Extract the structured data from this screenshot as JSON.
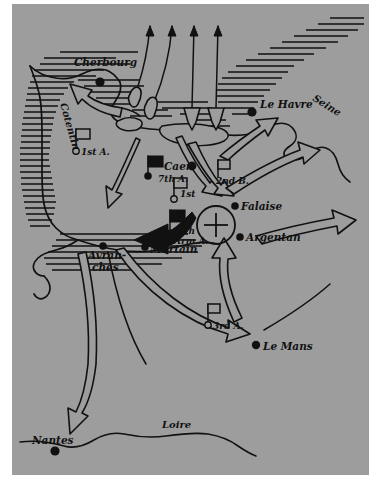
{
  "map": {
    "title": "Normandy Campaign — Allied Breakout and the Falaise Pocket",
    "background_color": "#9d9d9d",
    "ink_color": "#111111",
    "paper_color": "#ffffff",
    "cities": [
      {
        "id": "cherbourg",
        "label": "Cherbourg",
        "marker": "filled-dot"
      },
      {
        "id": "le-havre",
        "label": "Le Havre",
        "marker": "filled-dot"
      },
      {
        "id": "caen",
        "label": "Caen",
        "marker": "filled-dot"
      },
      {
        "id": "falaise",
        "label": "Falaise",
        "marker": "filled-dot"
      },
      {
        "id": "argentan",
        "label": "Argentan",
        "marker": "filled-dot"
      },
      {
        "id": "avranches",
        "label": "Avran-",
        "label2": "ches",
        "marker": "filled-dot"
      },
      {
        "id": "mortain",
        "label": "Mortain",
        "marker": "filled-dot"
      },
      {
        "id": "le-mans",
        "label": "Le Mans",
        "marker": "filled-dot"
      },
      {
        "id": "nantes",
        "label": "Nantes",
        "marker": "filled-dot"
      }
    ],
    "regions": [
      {
        "id": "cotentin",
        "label": "Cotentin",
        "orientation": "vertical"
      }
    ],
    "rivers": [
      {
        "id": "seine",
        "label": "Seine"
      },
      {
        "id": "loire",
        "label": "Loire"
      }
    ],
    "units": [
      {
        "id": "first-army-cotentin",
        "label": "1st A.",
        "flag": "hollow",
        "marker": "open-circle",
        "side": "allied"
      },
      {
        "id": "seventh-army",
        "label": "7th A.",
        "flag": "solid",
        "marker": "filled-dot",
        "side": "german"
      },
      {
        "id": "second-british-army",
        "label": "2nd B.",
        "flag": "hollow",
        "marker": "none",
        "side": "allied"
      },
      {
        "id": "first-army-center",
        "label": "1st",
        "flag": "hollow",
        "marker": "open-circle",
        "side": "allied"
      },
      {
        "id": "fifth-panzer-army",
        "label": "5th",
        "label2": "Arm.A.",
        "flag": "solid",
        "marker": "filled-dot",
        "side": "german"
      },
      {
        "id": "third-army",
        "label": "3rd A.",
        "flag": "hollow",
        "marker": "open-circle",
        "side": "allied"
      }
    ],
    "symbols": [
      {
        "id": "falaise-pocket",
        "name": "encirclement-circle-cross",
        "meaning": "pocket"
      },
      {
        "id": "mortain-counterattack",
        "name": "solid-black-arrow",
        "meaning": "german counterattack toward Avranches"
      },
      {
        "id": "invasion-arrows",
        "name": "seaborne-assault-arrows",
        "count": 4
      },
      {
        "id": "beachheads",
        "name": "stippled-beach-areas",
        "count": 2
      }
    ]
  }
}
